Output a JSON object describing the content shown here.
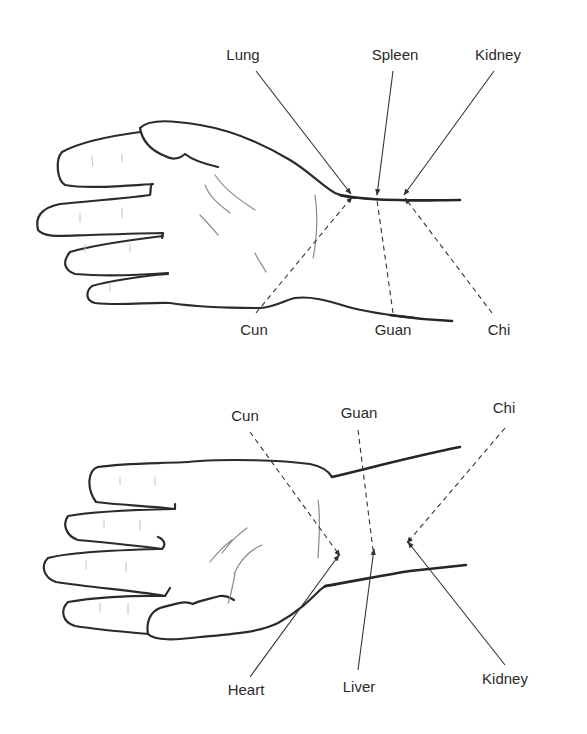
{
  "diagram": {
    "panels": [
      {
        "id": "top",
        "view": "right-hand",
        "organs": [
          {
            "label": "Lung",
            "position": "Cun"
          },
          {
            "label": "Spleen",
            "position": "Guan"
          },
          {
            "label": "Kidney",
            "position": "Chi"
          }
        ],
        "positions": [
          {
            "label": "Cun"
          },
          {
            "label": "Guan"
          },
          {
            "label": "Chi"
          }
        ]
      },
      {
        "id": "bottom",
        "view": "left-hand",
        "positions": [
          {
            "label": "Cun"
          },
          {
            "label": "Guan"
          },
          {
            "label": "Chi"
          }
        ],
        "organs": [
          {
            "label": "Heart",
            "position": "Cun"
          },
          {
            "label": "Liver",
            "position": "Guan"
          },
          {
            "label": "Kidney",
            "position": "Chi"
          }
        ]
      }
    ],
    "legend": {
      "solid_arrow": "organ label",
      "dashed_arrow": "pulse position label"
    },
    "colors": {
      "line": "#2b2b2b",
      "text": "#2a2a2a",
      "background": "#ffffff"
    }
  }
}
